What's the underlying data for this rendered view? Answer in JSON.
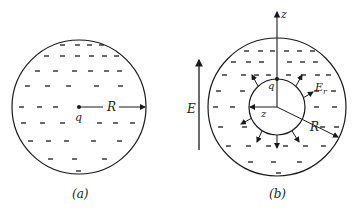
{
  "figure": {
    "panel_a": {
      "caption": "(a)",
      "charge_label": "q",
      "radius_label": "R",
      "center": [
        79,
        107
      ],
      "radius": 67
    },
    "panel_b": {
      "caption": "(b)",
      "axis_label_vertical": "z",
      "axis_label_horizontal": "z",
      "charge_label": "q",
      "field_label": "E",
      "field_subscript": "r",
      "radius_label": "R",
      "external_field_label": "E",
      "center": [
        277,
        107
      ],
      "outer_radius": 69,
      "inner_radius": 28
    },
    "colors": {
      "stroke": "#1a1a1a",
      "background": "#ffffff"
    }
  }
}
